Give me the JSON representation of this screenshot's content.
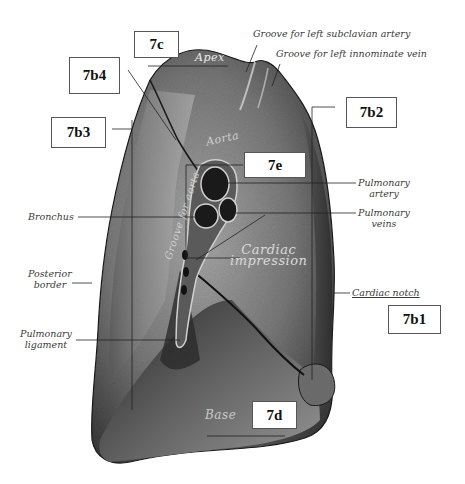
{
  "figure": {
    "labels": {
      "groove_subclavian": "Groove for left subclavian artery",
      "groove_innominate": "Groove for left innominate vein",
      "apex": "Apex",
      "aorta": "Aorta",
      "groove_aorta": "Groove for aorta",
      "pulmonary_artery": [
        "Pulmonary",
        "artery"
      ],
      "pulmonary_veins": [
        "Pulmonary",
        "veins"
      ],
      "bronchus": "Bronchus",
      "posterior_border": [
        "Posterior",
        "border"
      ],
      "cardiac_impression": [
        "Cardiac",
        "impression"
      ],
      "cardiac_notch": "Cardiac notch",
      "pulmonary_ligament": [
        "Pulmonary",
        "ligament"
      ],
      "base": "Base"
    },
    "boxes": {
      "b7c": "7c",
      "b7b4": "7b4",
      "b7b3": "7b3",
      "b7b2": "7b2",
      "b7e": "7e",
      "b7b1": "7b1",
      "b7d": "7d"
    },
    "colors": {
      "lung_dark": "#2a2a2a",
      "lung_mid": "#6e6e6e",
      "lung_light": "#b5b5b5",
      "line": "#222222",
      "box_border": "#555555"
    }
  }
}
